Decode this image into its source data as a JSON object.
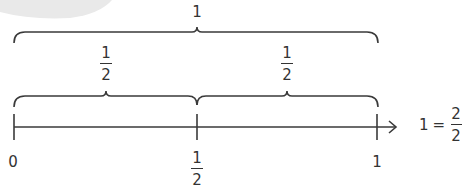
{
  "colors": {
    "line": "#3a3a3a",
    "text": "#333333",
    "blob": "#e9e9e9"
  },
  "top_brace": {
    "label": "1"
  },
  "half_braces": [
    {
      "num": "1",
      "den": "2"
    },
    {
      "num": "1",
      "den": "2"
    }
  ],
  "number_line": {
    "ticks": [
      {
        "label": "0"
      },
      {
        "num": "1",
        "den": "2"
      },
      {
        "label": "1"
      }
    ]
  },
  "equation": {
    "lhs": "1",
    "op": "=",
    "num": "2",
    "den": "2"
  }
}
